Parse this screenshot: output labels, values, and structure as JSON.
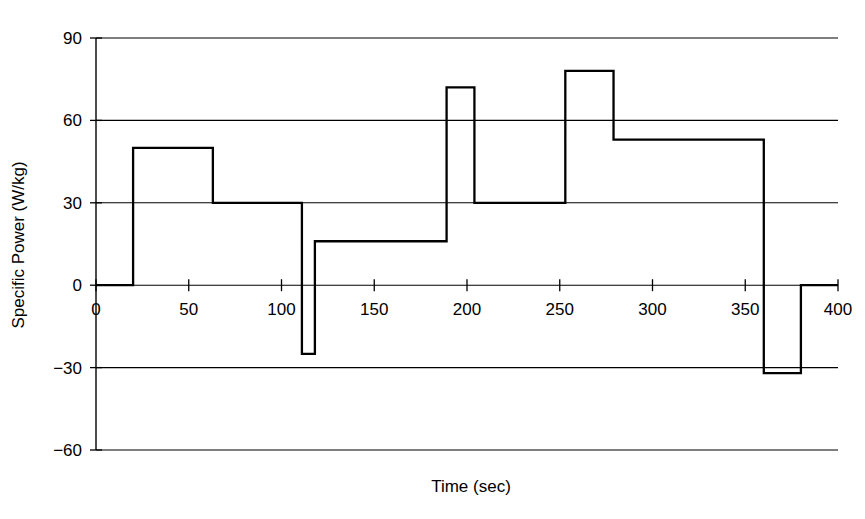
{
  "chart_data": {
    "type": "line",
    "subtype": "step",
    "title": "",
    "xlabel": "Time (sec)",
    "ylabel": "Specific Power (W/kg)",
    "xlim": [
      0,
      400
    ],
    "ylim": [
      -60,
      90
    ],
    "xticks": [
      0,
      50,
      100,
      150,
      200,
      250,
      300,
      350,
      400
    ],
    "xtick_labels": [
      "0",
      "50",
      "100",
      "150",
      "200",
      "250",
      "300",
      "350",
      "400"
    ],
    "yticks": [
      -60,
      -30,
      0,
      30,
      60,
      90
    ],
    "ytick_labels": [
      "−60",
      "−30",
      "0",
      "30",
      "60",
      "90"
    ],
    "grid": true,
    "grid_axis": "y",
    "legend": false,
    "legend_position": "none",
    "line_color": "#000000",
    "background_color": "#ffffff",
    "x": [
      0,
      20,
      20,
      63,
      63,
      111,
      111,
      118,
      118,
      188,
      188,
      189,
      189,
      204,
      204,
      253,
      253,
      279,
      279,
      360,
      360,
      380,
      380,
      400
    ],
    "y": [
      0,
      0,
      50,
      50,
      30,
      30,
      -25,
      -25,
      16,
      16,
      16,
      16,
      72,
      72,
      30,
      30,
      78,
      78,
      53,
      53,
      -32,
      -32,
      0,
      0
    ],
    "steps": [
      {
        "t_start": 0,
        "t_end": 20,
        "value": 0
      },
      {
        "t_start": 20,
        "t_end": 63,
        "value": 50
      },
      {
        "t_start": 63,
        "t_end": 111,
        "value": 30
      },
      {
        "t_start": 111,
        "t_end": 118,
        "value": -25
      },
      {
        "t_start": 118,
        "t_end": 189,
        "value": 16
      },
      {
        "t_start": 189,
        "t_end": 204,
        "value": 72
      },
      {
        "t_start": 204,
        "t_end": 253,
        "value": 30
      },
      {
        "t_start": 253,
        "t_end": 279,
        "value": 78
      },
      {
        "t_start": 279,
        "t_end": 360,
        "value": 53
      },
      {
        "t_start": 360,
        "t_end": 380,
        "value": -32
      },
      {
        "t_start": 380,
        "t_end": 400,
        "value": 0
      }
    ]
  }
}
